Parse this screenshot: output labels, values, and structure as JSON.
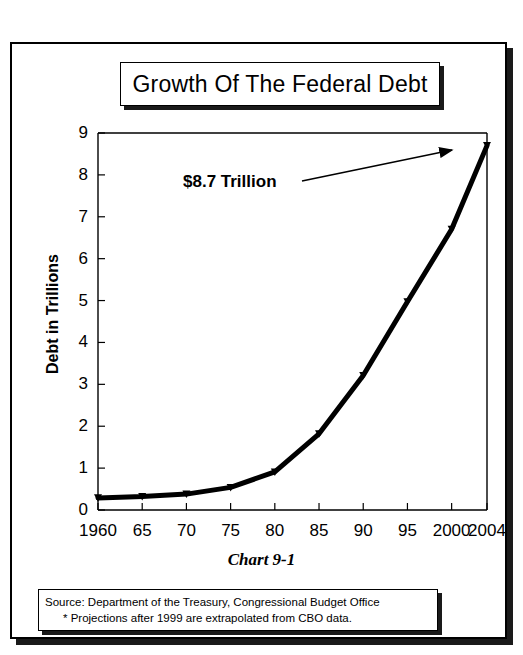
{
  "title": "Growth Of The Federal Debt",
  "caption": "Chart 9-1",
  "annotation": "$8.7 Trillion",
  "ylabel": "Debt in Trillions",
  "source": {
    "line1": "Source:  Department of the Treasury, Congressional Budget Office",
    "line2": "*  Projections after 1999 are extrapolated from CBO data."
  },
  "colors": {
    "line": "#000000",
    "axis": "#000000",
    "background": "#ffffff",
    "shadow": "#1a1a1a"
  },
  "chart_data": {
    "type": "line",
    "title": "Growth Of The Federal Debt",
    "xlabel": "",
    "ylabel": "Debt in Trillions",
    "categories": [
      "1960",
      "65",
      "70",
      "75",
      "80",
      "85",
      "90",
      "95",
      "2000",
      "2004"
    ],
    "x": [
      1960,
      1965,
      1970,
      1975,
      1980,
      1985,
      1990,
      1995,
      2000,
      2004
    ],
    "values": [
      0.29,
      0.32,
      0.38,
      0.54,
      0.91,
      1.82,
      3.21,
      4.97,
      6.7,
      8.7
    ],
    "ylim": [
      0,
      9
    ],
    "yticks": [
      0,
      1,
      2,
      3,
      4,
      5,
      6,
      7,
      8,
      9
    ],
    "xtick_labels": [
      "1960",
      "65",
      "70",
      "75",
      "80",
      "85",
      "90",
      "95",
      "2000",
      "2004"
    ],
    "grid": false,
    "legend": null,
    "annotations": [
      {
        "text": "$8.7 Trillion",
        "points_to_x": 2004,
        "points_to_y": 8.7
      }
    ],
    "series": [
      {
        "name": "Federal Debt",
        "values": [
          0.29,
          0.32,
          0.38,
          0.54,
          0.91,
          1.82,
          3.21,
          4.97,
          6.7,
          8.7
        ]
      }
    ]
  }
}
